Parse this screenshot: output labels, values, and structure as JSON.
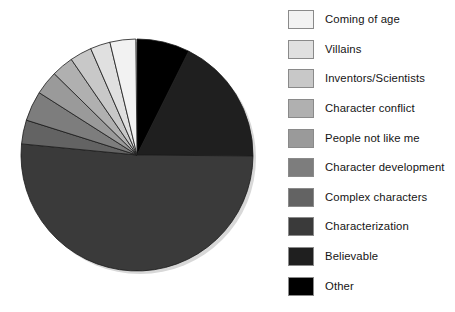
{
  "chart_data": {
    "type": "pie",
    "title": "",
    "legend_position": "right",
    "start_angle_deg": 0,
    "direction": "clockwise",
    "categories": [
      "Coming of age",
      "Villains",
      "Inventors/Scientists",
      "Character conflict",
      "People not like me",
      "Character development",
      "Complex characters",
      "Characterization",
      "Believable",
      "Other"
    ],
    "values": [
      3.6,
      2.8,
      3.1,
      3.1,
      3.3,
      4.2,
      3.3,
      51.4,
      17.8,
      7.4
    ],
    "value_unit": "percent",
    "colors": [
      "#f2f2f2",
      "#e0e0e0",
      "#c8c8c8",
      "#b0b0b0",
      "#9a9a9a",
      "#7d7d7d",
      "#636363",
      "#3a3a3a",
      "#1f1f1f",
      "#000000"
    ],
    "slices": [
      {
        "label": "Other",
        "percent": 7.4,
        "color": "#000000",
        "start_deg": 0.0,
        "end_deg": 26.5
      },
      {
        "label": "Believable",
        "percent": 17.8,
        "color": "#1f1f1f",
        "start_deg": 26.5,
        "end_deg": 90.5
      },
      {
        "label": "Characterization",
        "percent": 51.4,
        "color": "#3a3a3a",
        "start_deg": 90.5,
        "end_deg": 275.5
      },
      {
        "label": "Complex characters",
        "percent": 3.3,
        "color": "#636363",
        "start_deg": 275.5,
        "end_deg": 287.5
      },
      {
        "label": "Character development",
        "percent": 4.2,
        "color": "#7d7d7d",
        "start_deg": 287.5,
        "end_deg": 302.5
      },
      {
        "label": "People not like me",
        "percent": 3.3,
        "color": "#9a9a9a",
        "start_deg": 302.5,
        "end_deg": 314.5
      },
      {
        "label": "Character conflict",
        "percent": 3.1,
        "color": "#b0b0b0",
        "start_deg": 314.5,
        "end_deg": 325.5
      },
      {
        "label": "Inventors/Scientists",
        "percent": 3.1,
        "color": "#c8c8c8",
        "start_deg": 325.5,
        "end_deg": 336.5
      },
      {
        "label": "Villains",
        "percent": 2.8,
        "color": "#e0e0e0",
        "start_deg": 336.5,
        "end_deg": 346.5
      },
      {
        "label": "Coming of age",
        "percent": 3.6,
        "color": "#f2f2f2",
        "start_deg": 346.5,
        "end_deg": 359.4
      }
    ],
    "geometry": {
      "center_x": 137,
      "center_y": 155,
      "radius": 116
    }
  },
  "legend": {
    "items": [
      {
        "label": "Coming of age",
        "color": "#f2f2f2"
      },
      {
        "label": "Villains",
        "color": "#e0e0e0"
      },
      {
        "label": "Inventors/Scientists",
        "color": "#c8c8c8"
      },
      {
        "label": "Character conflict",
        "color": "#b0b0b0"
      },
      {
        "label": "People not like me",
        "color": "#9a9a9a"
      },
      {
        "label": "Character development",
        "color": "#7d7d7d"
      },
      {
        "label": "Complex characters",
        "color": "#636363"
      },
      {
        "label": "Characterization",
        "color": "#3a3a3a"
      },
      {
        "label": "Believable",
        "color": "#1f1f1f"
      },
      {
        "label": "Other",
        "color": "#000000"
      }
    ]
  }
}
